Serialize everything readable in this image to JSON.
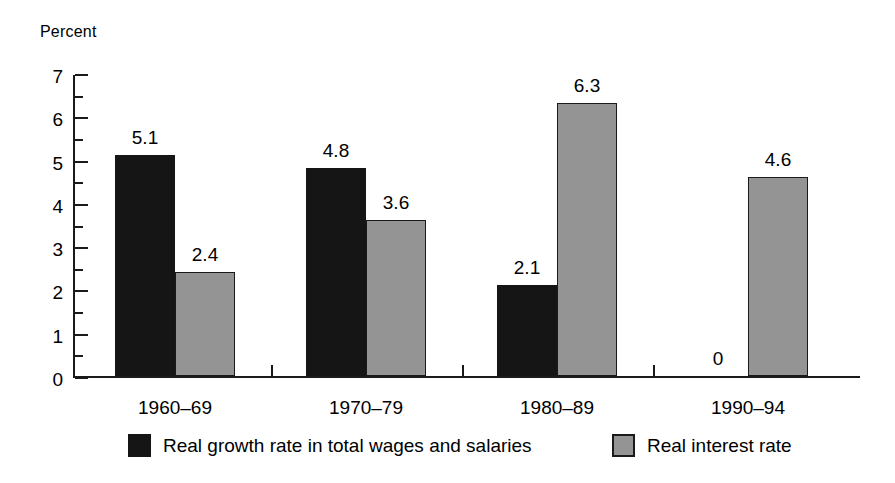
{
  "chart_data": {
    "type": "bar",
    "title": "",
    "subtitle": "",
    "xlabel": "",
    "ylabel": "Percent",
    "ylim": [
      0,
      7
    ],
    "ytick_step": 1,
    "yminor_step": 0.5,
    "grid": false,
    "legend_position": "bottom",
    "categories": [
      "1960–69",
      "1970–79",
      "1980–89",
      "1990–94"
    ],
    "ytick_labels": [
      "0",
      "1",
      "2",
      "3",
      "4",
      "5",
      "6",
      "7"
    ],
    "series": [
      {
        "name": "Real growth rate in total wages and salaries",
        "color": "#151515",
        "values": [
          5.1,
          4.8,
          2.1,
          0
        ],
        "value_labels": [
          "5.1",
          "4.8",
          "2.1",
          "0"
        ]
      },
      {
        "name": "Real interest rate",
        "color": "#949494",
        "values": [
          2.4,
          3.6,
          6.3,
          4.6
        ],
        "value_labels": [
          "2.4",
          "3.6",
          "6.3",
          "4.6"
        ]
      }
    ]
  },
  "axis": {
    "percent_label": "Percent"
  },
  "legend": {
    "items": [
      {
        "label": "Real growth rate in total wages and salaries",
        "swatch": "series-dark"
      },
      {
        "label": "Real interest rate",
        "swatch": "series-gray"
      }
    ]
  },
  "colors": {
    "series_dark": "#151515",
    "series_gray": "#949494",
    "axis": "#1a1a1a",
    "background": "#ffffff"
  }
}
